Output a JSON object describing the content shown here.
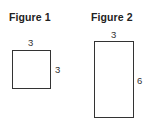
{
  "figures": [
    {
      "title": "Figure 1",
      "shape": "square",
      "top_label": "3",
      "side_label": "3",
      "width": 3,
      "height": 3
    },
    {
      "title": "Figure 2",
      "shape": "rectangle",
      "top_label": "3",
      "side_label": "6",
      "width": 3,
      "height": 6
    }
  ],
  "colors": {
    "stroke": "#333333",
    "background": "#ffffff"
  }
}
